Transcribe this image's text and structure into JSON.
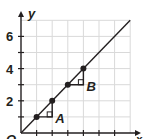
{
  "chart_data": {
    "type": "line",
    "title": "",
    "xlabel": "x",
    "ylabel": "y",
    "origin_label": "O",
    "xlim": [
      0,
      7
    ],
    "ylim": [
      0,
      7
    ],
    "grid": true,
    "y_tick_labels": [
      "2",
      "4",
      "6"
    ],
    "y_tick_values": [
      2,
      4,
      6
    ],
    "x_ticks": [
      1,
      2,
      3,
      4,
      5,
      6
    ],
    "y_ticks": [
      1,
      2,
      3,
      4,
      5,
      6
    ],
    "series": [
      {
        "name": "y = x",
        "x": [
          0,
          7
        ],
        "y": [
          0,
          7
        ]
      }
    ],
    "points": [
      {
        "x": 1,
        "y": 1
      },
      {
        "x": 2,
        "y": 2
      },
      {
        "x": 3,
        "y": 3
      },
      {
        "x": 4,
        "y": 4
      }
    ],
    "slope_triangles": [
      {
        "label": "A",
        "from": [
          1,
          1
        ],
        "corner": [
          2,
          1
        ],
        "to": [
          2,
          2
        ]
      },
      {
        "label": "B",
        "from": [
          3,
          3
        ],
        "corner": [
          4,
          3
        ],
        "to": [
          4,
          4
        ]
      }
    ],
    "colors": {
      "axis": "#231f20",
      "grid": "#d9d9d9",
      "line": "#231f20"
    }
  }
}
